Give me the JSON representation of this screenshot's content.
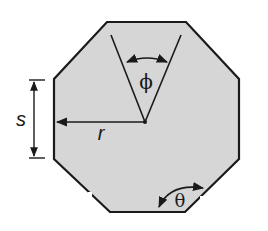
{
  "diagram": {
    "shape": "regular-octagon",
    "fill_color": "#d6d6d6",
    "stroke_color": "#1a1a1a",
    "labels": {
      "side": "s",
      "radius": "r",
      "central_angle": "ϕ",
      "interior_angle": "θ"
    }
  }
}
